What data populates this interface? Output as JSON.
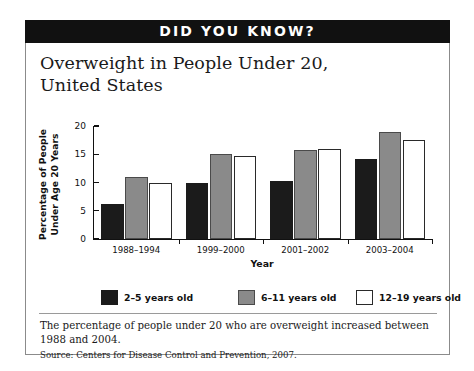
{
  "banner": {
    "text": "DID YOU KNOW?"
  },
  "headline": {
    "line1": "Overweight in People Under 20,",
    "line2": "United States"
  },
  "caption": {
    "text": "The percentage of people under 20 who are overweight increased between 1988 and 2004."
  },
  "source": {
    "text": "Source: Centers for Disease Control and Prevention, 2007."
  },
  "colors": {
    "banner_bg": "#111111",
    "banner_fg": "#ffffff",
    "series_0": "#1b1b1b",
    "series_1": "#8a8a8a",
    "series_2": "#ffffff",
    "axis": "#111111",
    "frame": "#8b8b8b"
  },
  "chart_data": {
    "type": "bar",
    "title": "Overweight in People Under 20, United States",
    "xlabel": "Year",
    "ylabel": "Percentage of People Under Age 20 Years",
    "ylabel_line1": "Percentage of People",
    "ylabel_line2": "Under Age 20 Years",
    "categories": [
      "1988–1994",
      "1999–2000",
      "2001–2002",
      "2003–2004"
    ],
    "yticks": [
      0,
      5,
      10,
      15,
      20
    ],
    "ylim": [
      0,
      20
    ],
    "grid": false,
    "legend_position": "bottom",
    "series": [
      {
        "name": "2–5 years old",
        "color": "#1b1b1b",
        "values": [
          6.2,
          10.0,
          10.3,
          14.2
        ]
      },
      {
        "name": "6–11 years old",
        "color": "#8a8a8a",
        "values": [
          11.0,
          15.0,
          15.8,
          19.0
        ]
      },
      {
        "name": "12–19 years old",
        "color": "#ffffff",
        "values": [
          10.0,
          14.7,
          16.0,
          17.5
        ]
      }
    ]
  }
}
